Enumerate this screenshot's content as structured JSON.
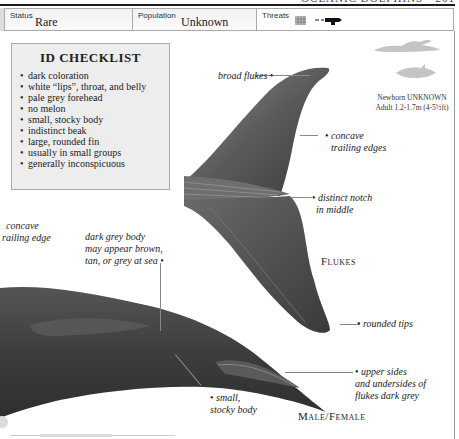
{
  "page_header": {
    "text": "OCEANIC DOLPHINS • 201"
  },
  "status_bar": {
    "status": {
      "label": "Status",
      "value": "Rare"
    },
    "population": {
      "label": "Population",
      "value": "Unknown"
    },
    "threats": {
      "label": "Threats",
      "icons": [
        "net-icon",
        "harpoon-icon"
      ]
    }
  },
  "checklist": {
    "title": "ID CHECKLIST",
    "items": [
      "dark coloration",
      "white “lips”, throat, and belly",
      "pale grey forehead",
      "no melon",
      "small, stocky body",
      "indistinct beak",
      "large, rounded fin",
      "usually in small groups",
      "generally inconspicuous"
    ]
  },
  "size_info": {
    "newborn": "Newborn UNKNOWN",
    "adult": "Adult 1.2-1.7m (4-5½ft)"
  },
  "annotations": {
    "broad_flukes": "broad flukes",
    "concave_trailing_edges_1": "concave",
    "concave_trailing_edges_2": "trailing edges",
    "distinct_notch_1": "distinct notch",
    "distinct_notch_2": "in middle",
    "concave_trailing_edge_left_1": "concave",
    "concave_trailing_edge_left_2": "railing edge",
    "dark_grey_body_1": "dark grey body",
    "dark_grey_body_2": "may appear brown,",
    "dark_grey_body_3": "tan, or grey at sea",
    "rounded_tips": "rounded tips",
    "upper_sides_1": "upper sides",
    "upper_sides_2": "and undersides of",
    "upper_sides_3": "flukes dark grey",
    "small_stocky_1": "small,",
    "small_stocky_2": "stocky body"
  },
  "captions": {
    "flukes": "Flukes",
    "male_female": "Male/Female"
  },
  "colors": {
    "body_dark": "#3a3a3a",
    "body_mid": "#555555",
    "checklist_bg": "#ededed",
    "silhouette": "#c4c4c4"
  }
}
